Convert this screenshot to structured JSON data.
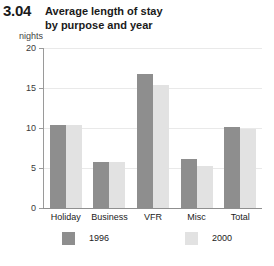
{
  "figure_number": "3.04",
  "title_lines": [
    "Average length of stay",
    "by purpose and year"
  ],
  "unit_label": "nights",
  "colors": {
    "series_1996": "#8e8e8e",
    "series_2000": "#e2e2e2",
    "gridline": "#e9e9e9",
    "axis": "#8f8f8f",
    "text": "#222222"
  },
  "chart_data": {
    "type": "bar",
    "title": "Average length of stay by purpose and year",
    "xlabel": "",
    "ylabel": "nights",
    "ylim": [
      0,
      20
    ],
    "yticks": [
      0,
      5,
      10,
      15,
      20
    ],
    "ytick_labels": [
      "0",
      "5",
      "10",
      "15",
      "20"
    ],
    "grid": true,
    "legend_position": "bottom",
    "categories": [
      "Holiday",
      "Business",
      "VFR",
      "Misc",
      "Total"
    ],
    "series": [
      {
        "name": "1996",
        "values": [
          10.4,
          5.7,
          16.7,
          6.1,
          10.1
        ]
      },
      {
        "name": "2000",
        "values": [
          10.4,
          5.7,
          15.4,
          5.3,
          9.9
        ]
      }
    ]
  }
}
